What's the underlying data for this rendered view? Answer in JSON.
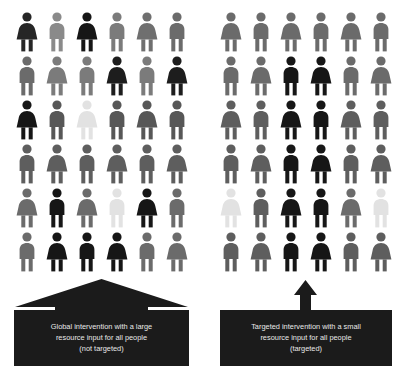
{
  "figure": {
    "type": "pictogram",
    "colors": {
      "background": "#ffffff",
      "caption_box": "#1b1b1b",
      "caption_text": "#e9e9e9",
      "arrow": "#1b1b1b",
      "shade_black": "#161616",
      "shade_dark": "#3c3c3c",
      "shade_mid_dark": "#575757",
      "shade_mid": "#6b6b6b",
      "shade_mid_light": "#8a8a8a",
      "shade_light": "#e2e2e2"
    },
    "grid": {
      "columns": 6,
      "rows": 6,
      "total_people": 36
    }
  },
  "panels": [
    {
      "id": "global",
      "name": "global-intervention-panel",
      "arrow": "wide-up-arrow",
      "caption_lines": [
        "Global intervention with a large",
        "resource input for all people",
        "(not targeted)"
      ],
      "caption_text": "Global intervention with a large resource input for all people (not targeted)",
      "people": [
        [
          {
            "sex": "female",
            "shade": "#262626"
          },
          {
            "sex": "male",
            "shade": "#8a8a8a"
          },
          {
            "sex": "female",
            "shade": "#161616"
          },
          {
            "sex": "male",
            "shade": "#7b7b7b"
          },
          {
            "sex": "female",
            "shade": "#6f6f6f"
          },
          {
            "sex": "male",
            "shade": "#6b6b6b"
          }
        ],
        [
          {
            "sex": "male",
            "shade": "#6b6b6b"
          },
          {
            "sex": "female",
            "shade": "#7b7b7b"
          },
          {
            "sex": "male",
            "shade": "#7b7b7b"
          },
          {
            "sex": "female",
            "shade": "#1d1d1d"
          },
          {
            "sex": "male",
            "shade": "#7b7b7b"
          },
          {
            "sex": "female",
            "shade": "#1d1d1d"
          }
        ],
        [
          {
            "sex": "female",
            "shade": "#161616"
          },
          {
            "sex": "male",
            "shade": "#575757"
          },
          {
            "sex": "female",
            "shade": "#e2e2e2"
          },
          {
            "sex": "male",
            "shade": "#575757"
          },
          {
            "sex": "female",
            "shade": "#575757"
          },
          {
            "sex": "male",
            "shade": "#575757"
          }
        ],
        [
          {
            "sex": "male",
            "shade": "#5e5e5e"
          },
          {
            "sex": "female",
            "shade": "#5e5e5e"
          },
          {
            "sex": "male",
            "shade": "#5e5e5e"
          },
          {
            "sex": "female",
            "shade": "#5e5e5e"
          },
          {
            "sex": "male",
            "shade": "#5e5e5e"
          },
          {
            "sex": "female",
            "shade": "#5e5e5e"
          }
        ],
        [
          {
            "sex": "female",
            "shade": "#6b6b6b"
          },
          {
            "sex": "male",
            "shade": "#161616"
          },
          {
            "sex": "female",
            "shade": "#6b6b6b"
          },
          {
            "sex": "male",
            "shade": "#e2e2e2"
          },
          {
            "sex": "female",
            "shade": "#161616"
          },
          {
            "sex": "male",
            "shade": "#6b6b6b"
          }
        ],
        [
          {
            "sex": "male",
            "shade": "#6b6b6b"
          },
          {
            "sex": "female",
            "shade": "#161616"
          },
          {
            "sex": "male",
            "shade": "#161616"
          },
          {
            "sex": "female",
            "shade": "#161616"
          },
          {
            "sex": "male",
            "shade": "#6b6b6b"
          },
          {
            "sex": "female",
            "shade": "#6b6b6b"
          }
        ]
      ]
    },
    {
      "id": "targeted",
      "name": "targeted-intervention-panel",
      "arrow": "narrow-up-arrow",
      "caption_lines": [
        "Targeted intervention with a small",
        "resource input for all people",
        "(targeted)"
      ],
      "caption_text": "Targeted intervention with a small resource input for all people (targeted)",
      "people": [
        [
          {
            "sex": "female",
            "shade": "#6b6b6b"
          },
          {
            "sex": "male",
            "shade": "#6b6b6b"
          },
          {
            "sex": "female",
            "shade": "#6b6b6b"
          },
          {
            "sex": "male",
            "shade": "#6b6b6b"
          },
          {
            "sex": "female",
            "shade": "#6b6b6b"
          },
          {
            "sex": "male",
            "shade": "#6b6b6b"
          }
        ],
        [
          {
            "sex": "male",
            "shade": "#6b6b6b"
          },
          {
            "sex": "female",
            "shade": "#6b6b6b"
          },
          {
            "sex": "male",
            "shade": "#161616"
          },
          {
            "sex": "female",
            "shade": "#161616"
          },
          {
            "sex": "male",
            "shade": "#6b6b6b"
          },
          {
            "sex": "female",
            "shade": "#6b6b6b"
          }
        ],
        [
          {
            "sex": "female",
            "shade": "#5e5e5e"
          },
          {
            "sex": "male",
            "shade": "#5e5e5e"
          },
          {
            "sex": "female",
            "shade": "#161616"
          },
          {
            "sex": "male",
            "shade": "#161616"
          },
          {
            "sex": "female",
            "shade": "#5e5e5e"
          },
          {
            "sex": "male",
            "shade": "#5e5e5e"
          }
        ],
        [
          {
            "sex": "male",
            "shade": "#5e5e5e"
          },
          {
            "sex": "female",
            "shade": "#5e5e5e"
          },
          {
            "sex": "male",
            "shade": "#161616"
          },
          {
            "sex": "female",
            "shade": "#161616"
          },
          {
            "sex": "male",
            "shade": "#5e5e5e"
          },
          {
            "sex": "female",
            "shade": "#5e5e5e"
          }
        ],
        [
          {
            "sex": "female",
            "shade": "#e2e2e2"
          },
          {
            "sex": "male",
            "shade": "#5e5e5e"
          },
          {
            "sex": "female",
            "shade": "#161616"
          },
          {
            "sex": "male",
            "shade": "#161616"
          },
          {
            "sex": "female",
            "shade": "#6b6b6b"
          },
          {
            "sex": "male",
            "shade": "#e2e2e2"
          }
        ],
        [
          {
            "sex": "male",
            "shade": "#5e5e5e"
          },
          {
            "sex": "female",
            "shade": "#5e5e5e"
          },
          {
            "sex": "male",
            "shade": "#161616"
          },
          {
            "sex": "female",
            "shade": "#161616"
          },
          {
            "sex": "male",
            "shade": "#5e5e5e"
          },
          {
            "sex": "female",
            "shade": "#5e5e5e"
          }
        ]
      ]
    }
  ]
}
